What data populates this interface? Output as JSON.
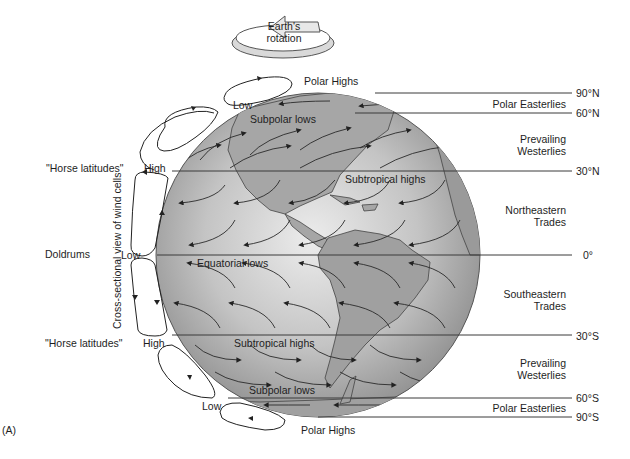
{
  "figure": {
    "panel_label": "(A)",
    "rotation": {
      "line1": "Earth's",
      "line2": "rotation"
    },
    "latitudes": [
      "90°N",
      "60°N",
      "30°N",
      "0°",
      "30°S",
      "60°S",
      "90°S"
    ],
    "wind_belts": {
      "polar_easterlies_n": "Polar Easterlies",
      "westerlies_n": {
        "line1": "Prevailing",
        "line2": "Westerlies"
      },
      "ne_trades": {
        "line1": "Northeastern",
        "line2": "Trades"
      },
      "se_trades": {
        "line1": "Southeastern",
        "line2": "Trades"
      },
      "westerlies_s": {
        "line1": "Prevailing",
        "line2": "Westerlies"
      },
      "polar_easterlies_s": "Polar Easterlies"
    },
    "pressure_zones": {
      "polar_highs_n": "Polar Highs",
      "subpolar_lows_n": "Subpolar lows",
      "subtropical_highs_n": "Subtropical highs",
      "equatorial_lows": "Equatorial lows",
      "subtropical_highs_s": "Subtropical highs",
      "subpolar_lows_s": "Subpolar lows",
      "polar_highs_s": "Polar Highs"
    },
    "cell_labels": {
      "low_n": "Low",
      "high_n": "High",
      "low_eq": "Low",
      "high_s": "High",
      "low_s": "Low"
    },
    "left_labels": {
      "horse_n": "\"Horse latitudes\"",
      "doldrums": "Doldrums",
      "horse_s": "\"Horse latitudes\""
    },
    "cross_section_label": "Cross-sectional view of wind cells"
  },
  "colors": {
    "globe_light": "#e6e6e6",
    "globe_dark": "#8c8c8c",
    "land": "#9e9e9e",
    "line": "#3a3a3a"
  }
}
